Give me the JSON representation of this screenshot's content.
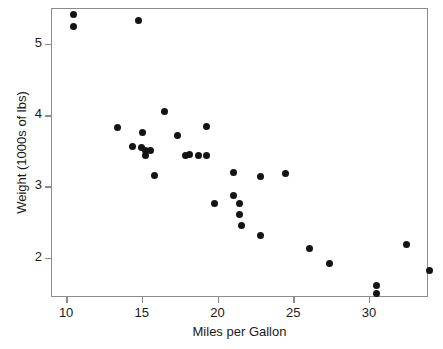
{
  "chart_data": {
    "type": "scatter",
    "title": "",
    "xlabel": "Miles per Gallon",
    "ylabel": "Weight (1000s of lbs)",
    "xlim": [
      9.0,
      33.9
    ],
    "ylim": [
      1.45,
      5.5
    ],
    "xticks": [
      10,
      15,
      20,
      25,
      30
    ],
    "yticks": [
      2,
      3,
      4,
      5
    ],
    "xtick_labels": [
      "10",
      "15",
      "20",
      "25",
      "30"
    ],
    "ytick_labels": [
      "2",
      "3",
      "4",
      "5"
    ],
    "grid": false,
    "legend": null,
    "marker": {
      "shape": "circle",
      "color": "#141414",
      "size_px": 7
    },
    "frame_color": "#8c8c8c",
    "background": "#ffffff",
    "n_points": 32,
    "points": [
      {
        "x": 10.4,
        "y": 5.42
      },
      {
        "x": 10.4,
        "y": 5.25
      },
      {
        "x": 14.7,
        "y": 5.34
      },
      {
        "x": 13.3,
        "y": 3.84
      },
      {
        "x": 16.4,
        "y": 4.07
      },
      {
        "x": 14.3,
        "y": 3.57
      },
      {
        "x": 14.9,
        "y": 3.56
      },
      {
        "x": 15.0,
        "y": 3.77
      },
      {
        "x": 15.2,
        "y": 3.44
      },
      {
        "x": 15.2,
        "y": 3.52
      },
      {
        "x": 15.5,
        "y": 3.52
      },
      {
        "x": 15.8,
        "y": 3.17
      },
      {
        "x": 17.3,
        "y": 3.73
      },
      {
        "x": 19.2,
        "y": 3.85
      },
      {
        "x": 17.8,
        "y": 3.44
      },
      {
        "x": 18.1,
        "y": 3.46
      },
      {
        "x": 18.7,
        "y": 3.44
      },
      {
        "x": 19.2,
        "y": 3.44
      },
      {
        "x": 21.0,
        "y": 3.21
      },
      {
        "x": 22.8,
        "y": 3.15
      },
      {
        "x": 24.4,
        "y": 3.19
      },
      {
        "x": 19.7,
        "y": 2.77
      },
      {
        "x": 21.0,
        "y": 2.88
      },
      {
        "x": 21.4,
        "y": 2.78
      },
      {
        "x": 21.4,
        "y": 2.62
      },
      {
        "x": 21.5,
        "y": 2.46
      },
      {
        "x": 22.8,
        "y": 2.32
      },
      {
        "x": 26.0,
        "y": 2.14
      },
      {
        "x": 27.3,
        "y": 1.94
      },
      {
        "x": 30.4,
        "y": 1.62
      },
      {
        "x": 30.4,
        "y": 1.51
      },
      {
        "x": 32.4,
        "y": 2.2
      },
      {
        "x": 33.9,
        "y": 1.84
      }
    ]
  }
}
